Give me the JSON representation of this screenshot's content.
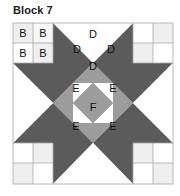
{
  "title": "Block 7",
  "colors": {
    "dark": "#5b5b5b",
    "mid": "#9c9c9c",
    "light": "#efefef",
    "white": "#ffffff",
    "grid_line": "#9a9a9a"
  },
  "labels": {
    "corner_patch": "B",
    "hourglass": "D",
    "inner_corner": "E",
    "center": "F"
  },
  "grid": {
    "rows": 4,
    "cols": 4
  }
}
